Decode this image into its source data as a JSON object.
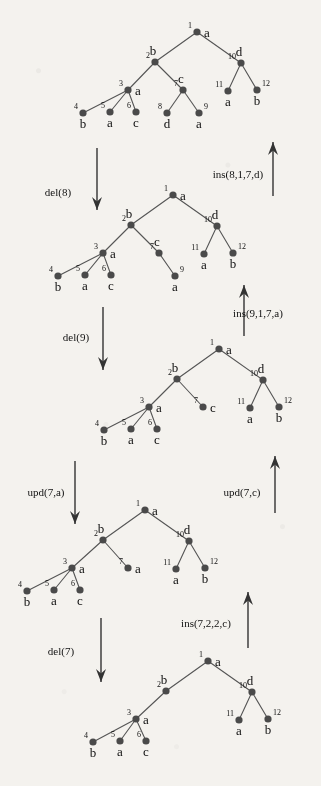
{
  "figure": {
    "type": "tree-edit-sequence-diagram",
    "node_color": "#4a4a4a",
    "edge_color": "#555555",
    "text_color": "#111111",
    "background": "#f4f2ee"
  },
  "trees": [
    {
      "name": "tree-1",
      "origin": [
        0,
        0
      ],
      "nodes": [
        {
          "id": "1",
          "label": "a",
          "x": 197,
          "y": 32,
          "id_side": "left",
          "label_side": "right"
        },
        {
          "id": "2",
          "label": "b",
          "x": 155,
          "y": 62,
          "id_side": "left",
          "label_side": "above"
        },
        {
          "id": "3",
          "label": "a",
          "x": 128,
          "y": 90,
          "id_side": "left",
          "label_side": "right"
        },
        {
          "id": "4",
          "label": "b",
          "x": 83,
          "y": 113,
          "id_side": "left",
          "label_side": "below"
        },
        {
          "id": "5",
          "label": "a",
          "x": 110,
          "y": 112,
          "id_side": "left",
          "label_side": "below"
        },
        {
          "id": "6",
          "label": "c",
          "x": 136,
          "y": 112,
          "id_side": "left",
          "label_side": "below"
        },
        {
          "id": "7",
          "label": "c",
          "x": 183,
          "y": 90,
          "id_side": "left",
          "label_side": "above"
        },
        {
          "id": "8",
          "label": "d",
          "x": 167,
          "y": 113,
          "id_side": "left",
          "label_side": "below"
        },
        {
          "id": "9",
          "label": "a",
          "x": 199,
          "y": 113,
          "id_side": "right",
          "label_side": "below"
        },
        {
          "id": "10",
          "label": "d",
          "x": 241,
          "y": 63,
          "id_side": "left",
          "label_side": "above"
        },
        {
          "id": "11",
          "label": "a",
          "x": 228,
          "y": 91,
          "id_side": "left",
          "label_side": "below"
        },
        {
          "id": "12",
          "label": "b",
          "x": 257,
          "y": 90,
          "id_side": "right",
          "label_side": "below"
        }
      ],
      "edges": [
        [
          "1",
          "2"
        ],
        [
          "1",
          "10"
        ],
        [
          "2",
          "3"
        ],
        [
          "2",
          "7"
        ],
        [
          "3",
          "4"
        ],
        [
          "3",
          "5"
        ],
        [
          "3",
          "6"
        ],
        [
          "7",
          "8"
        ],
        [
          "7",
          "9"
        ],
        [
          "10",
          "11"
        ],
        [
          "10",
          "12"
        ]
      ]
    },
    {
      "name": "tree-2",
      "origin": [
        0,
        0
      ],
      "nodes": [
        {
          "id": "1",
          "label": "a",
          "x": 173,
          "y": 195,
          "id_side": "left",
          "label_side": "right"
        },
        {
          "id": "2",
          "label": "b",
          "x": 131,
          "y": 225,
          "id_side": "left",
          "label_side": "above"
        },
        {
          "id": "3",
          "label": "a",
          "x": 103,
          "y": 253,
          "id_side": "left",
          "label_side": "right"
        },
        {
          "id": "4",
          "label": "b",
          "x": 58,
          "y": 276,
          "id_side": "left",
          "label_side": "below"
        },
        {
          "id": "5",
          "label": "a",
          "x": 85,
          "y": 275,
          "id_side": "left",
          "label_side": "below"
        },
        {
          "id": "6",
          "label": "c",
          "x": 111,
          "y": 275,
          "id_side": "left",
          "label_side": "below"
        },
        {
          "id": "7",
          "label": "c",
          "x": 159,
          "y": 253,
          "id_side": "left",
          "label_side": "above"
        },
        {
          "id": "9",
          "label": "a",
          "x": 175,
          "y": 276,
          "id_side": "right",
          "label_side": "below"
        },
        {
          "id": "10",
          "label": "d",
          "x": 217,
          "y": 226,
          "id_side": "left",
          "label_side": "above"
        },
        {
          "id": "11",
          "label": "a",
          "x": 204,
          "y": 254,
          "id_side": "left",
          "label_side": "below"
        },
        {
          "id": "12",
          "label": "b",
          "x": 233,
          "y": 253,
          "id_side": "right",
          "label_side": "below"
        }
      ],
      "edges": [
        [
          "1",
          "2"
        ],
        [
          "1",
          "10"
        ],
        [
          "2",
          "3"
        ],
        [
          "2",
          "7"
        ],
        [
          "3",
          "4"
        ],
        [
          "3",
          "5"
        ],
        [
          "3",
          "6"
        ],
        [
          "7",
          "9"
        ],
        [
          "10",
          "11"
        ],
        [
          "10",
          "12"
        ]
      ]
    },
    {
      "name": "tree-3",
      "origin": [
        0,
        0
      ],
      "nodes": [
        {
          "id": "1",
          "label": "a",
          "x": 219,
          "y": 349,
          "id_side": "left",
          "label_side": "right"
        },
        {
          "id": "2",
          "label": "b",
          "x": 177,
          "y": 379,
          "id_side": "left",
          "label_side": "above"
        },
        {
          "id": "3",
          "label": "a",
          "x": 149,
          "y": 407,
          "id_side": "left",
          "label_side": "right"
        },
        {
          "id": "4",
          "label": "b",
          "x": 104,
          "y": 430,
          "id_side": "left",
          "label_side": "below"
        },
        {
          "id": "5",
          "label": "a",
          "x": 131,
          "y": 429,
          "id_side": "left",
          "label_side": "below"
        },
        {
          "id": "6",
          "label": "c",
          "x": 157,
          "y": 429,
          "id_side": "left",
          "label_side": "below"
        },
        {
          "id": "7",
          "label": "c",
          "x": 203,
          "y": 407,
          "id_side": "left",
          "label_side": "right"
        },
        {
          "id": "10",
          "label": "d",
          "x": 263,
          "y": 380,
          "id_side": "left",
          "label_side": "above"
        },
        {
          "id": "11",
          "label": "a",
          "x": 250,
          "y": 408,
          "id_side": "left",
          "label_side": "below"
        },
        {
          "id": "12",
          "label": "b",
          "x": 279,
          "y": 407,
          "id_side": "right",
          "label_side": "below"
        }
      ],
      "edges": [
        [
          "1",
          "2"
        ],
        [
          "1",
          "10"
        ],
        [
          "2",
          "3"
        ],
        [
          "2",
          "7"
        ],
        [
          "3",
          "4"
        ],
        [
          "3",
          "5"
        ],
        [
          "3",
          "6"
        ],
        [
          "10",
          "11"
        ],
        [
          "10",
          "12"
        ]
      ]
    },
    {
      "name": "tree-4",
      "origin": [
        0,
        0
      ],
      "nodes": [
        {
          "id": "1",
          "label": "a",
          "x": 145,
          "y": 510,
          "id_side": "left",
          "label_side": "right"
        },
        {
          "id": "2",
          "label": "b",
          "x": 103,
          "y": 540,
          "id_side": "left",
          "label_side": "above"
        },
        {
          "id": "3",
          "label": "a",
          "x": 72,
          "y": 568,
          "id_side": "left",
          "label_side": "right"
        },
        {
          "id": "4",
          "label": "b",
          "x": 27,
          "y": 591,
          "id_side": "left",
          "label_side": "below"
        },
        {
          "id": "5",
          "label": "a",
          "x": 54,
          "y": 590,
          "id_side": "left",
          "label_side": "below"
        },
        {
          "id": "6",
          "label": "c",
          "x": 80,
          "y": 590,
          "id_side": "left",
          "label_side": "below"
        },
        {
          "id": "7",
          "label": "a",
          "x": 128,
          "y": 568,
          "id_side": "left",
          "label_side": "right"
        },
        {
          "id": "10",
          "label": "d",
          "x": 189,
          "y": 541,
          "id_side": "left",
          "label_side": "above"
        },
        {
          "id": "11",
          "label": "a",
          "x": 176,
          "y": 569,
          "id_side": "left",
          "label_side": "below"
        },
        {
          "id": "12",
          "label": "b",
          "x": 205,
          "y": 568,
          "id_side": "right",
          "label_side": "below"
        }
      ],
      "edges": [
        [
          "1",
          "2"
        ],
        [
          "1",
          "10"
        ],
        [
          "2",
          "3"
        ],
        [
          "2",
          "7"
        ],
        [
          "3",
          "4"
        ],
        [
          "3",
          "5"
        ],
        [
          "3",
          "6"
        ],
        [
          "10",
          "11"
        ],
        [
          "10",
          "12"
        ]
      ]
    },
    {
      "name": "tree-5",
      "origin": [
        0,
        0
      ],
      "nodes": [
        {
          "id": "1",
          "label": "a",
          "x": 208,
          "y": 661,
          "id_side": "left",
          "label_side": "right"
        },
        {
          "id": "2",
          "label": "b",
          "x": 166,
          "y": 691,
          "id_side": "left",
          "label_side": "above"
        },
        {
          "id": "3",
          "label": "a",
          "x": 136,
          "y": 719,
          "id_side": "left",
          "label_side": "right"
        },
        {
          "id": "4",
          "label": "b",
          "x": 93,
          "y": 742,
          "id_side": "left",
          "label_side": "below"
        },
        {
          "id": "5",
          "label": "a",
          "x": 120,
          "y": 741,
          "id_side": "left",
          "label_side": "below"
        },
        {
          "id": "6",
          "label": "c",
          "x": 146,
          "y": 741,
          "id_side": "left",
          "label_side": "below"
        },
        {
          "id": "10",
          "label": "d",
          "x": 252,
          "y": 692,
          "id_side": "left",
          "label_side": "above"
        },
        {
          "id": "11",
          "label": "a",
          "x": 239,
          "y": 720,
          "id_side": "left",
          "label_side": "below"
        },
        {
          "id": "12",
          "label": "b",
          "x": 268,
          "y": 719,
          "id_side": "right",
          "label_side": "below"
        }
      ],
      "edges": [
        [
          "1",
          "2"
        ],
        [
          "1",
          "10"
        ],
        [
          "2",
          "3"
        ],
        [
          "3",
          "4"
        ],
        [
          "3",
          "5"
        ],
        [
          "3",
          "6"
        ],
        [
          "10",
          "11"
        ],
        [
          "10",
          "12"
        ]
      ]
    }
  ],
  "operations": [
    {
      "name": "op-del-8",
      "label": "del(8)",
      "direction": "down",
      "label_x": 58,
      "label_y": 196,
      "arrow_x": 97,
      "arrow_y1": 148,
      "arrow_y2": 210
    },
    {
      "name": "op-ins-8",
      "label": "ins(8,1,7,d)",
      "direction": "up",
      "label_x": 238,
      "label_y": 178,
      "arrow_x": 273,
      "arrow_y1": 196,
      "arrow_y2": 142
    },
    {
      "name": "op-del-9",
      "label": "del(9)",
      "direction": "down",
      "label_x": 76,
      "label_y": 341,
      "arrow_x": 103,
      "arrow_y1": 307,
      "arrow_y2": 370
    },
    {
      "name": "op-ins-9",
      "label": "ins(9,1,7,a)",
      "direction": "up",
      "label_x": 258,
      "label_y": 317,
      "arrow_x": 244,
      "arrow_y1": 336,
      "arrow_y2": 285
    },
    {
      "name": "op-upd-7-a",
      "label": "upd(7,a)",
      "direction": "down",
      "label_x": 46,
      "label_y": 496,
      "arrow_x": 75,
      "arrow_y1": 461,
      "arrow_y2": 524
    },
    {
      "name": "op-upd-7-c",
      "label": "upd(7,c)",
      "direction": "up",
      "label_x": 242,
      "label_y": 496,
      "arrow_x": 275,
      "arrow_y1": 513,
      "arrow_y2": 456
    },
    {
      "name": "op-del-7",
      "label": "del(7)",
      "direction": "down",
      "label_x": 61,
      "label_y": 655,
      "arrow_x": 101,
      "arrow_y1": 618,
      "arrow_y2": 682
    },
    {
      "name": "op-ins-7",
      "label": "ins(7,2,2,c)",
      "direction": "up",
      "label_x": 206,
      "label_y": 627,
      "arrow_x": 248,
      "arrow_y1": 648,
      "arrow_y2": 592
    }
  ]
}
